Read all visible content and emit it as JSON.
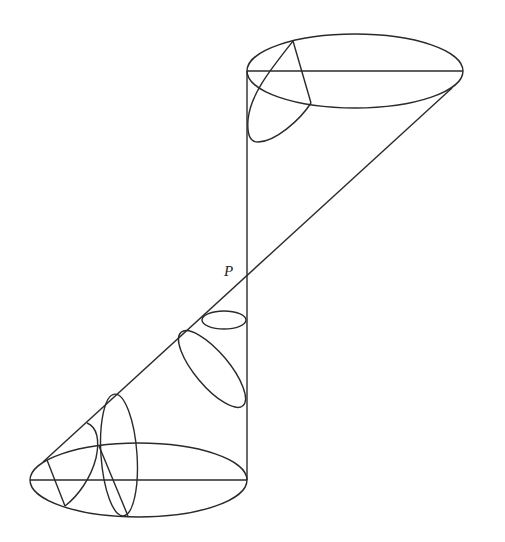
{
  "diagram": {
    "title": "",
    "labels": {
      "point_p": "P"
    },
    "colors": {
      "line": "#2a2a2a",
      "background": "#ffffff"
    },
    "elements": {
      "top_cone_base": "upper ellipse (cone base) with horizontal diameter",
      "bottom_cone_base": "lower ellipse (cone base) with horizontal diameter",
      "vertical_axis": "vertical line from top ellipse to bottom ellipse",
      "slant_line": "diagonal generator line through P",
      "cross_sections": [
        "tilted loop inside upper cone",
        "small horizontal ellipse below P",
        "tilted elongated ellipse",
        "tall ellipse in lower cone",
        "small loop in lower cone"
      ]
    }
  }
}
